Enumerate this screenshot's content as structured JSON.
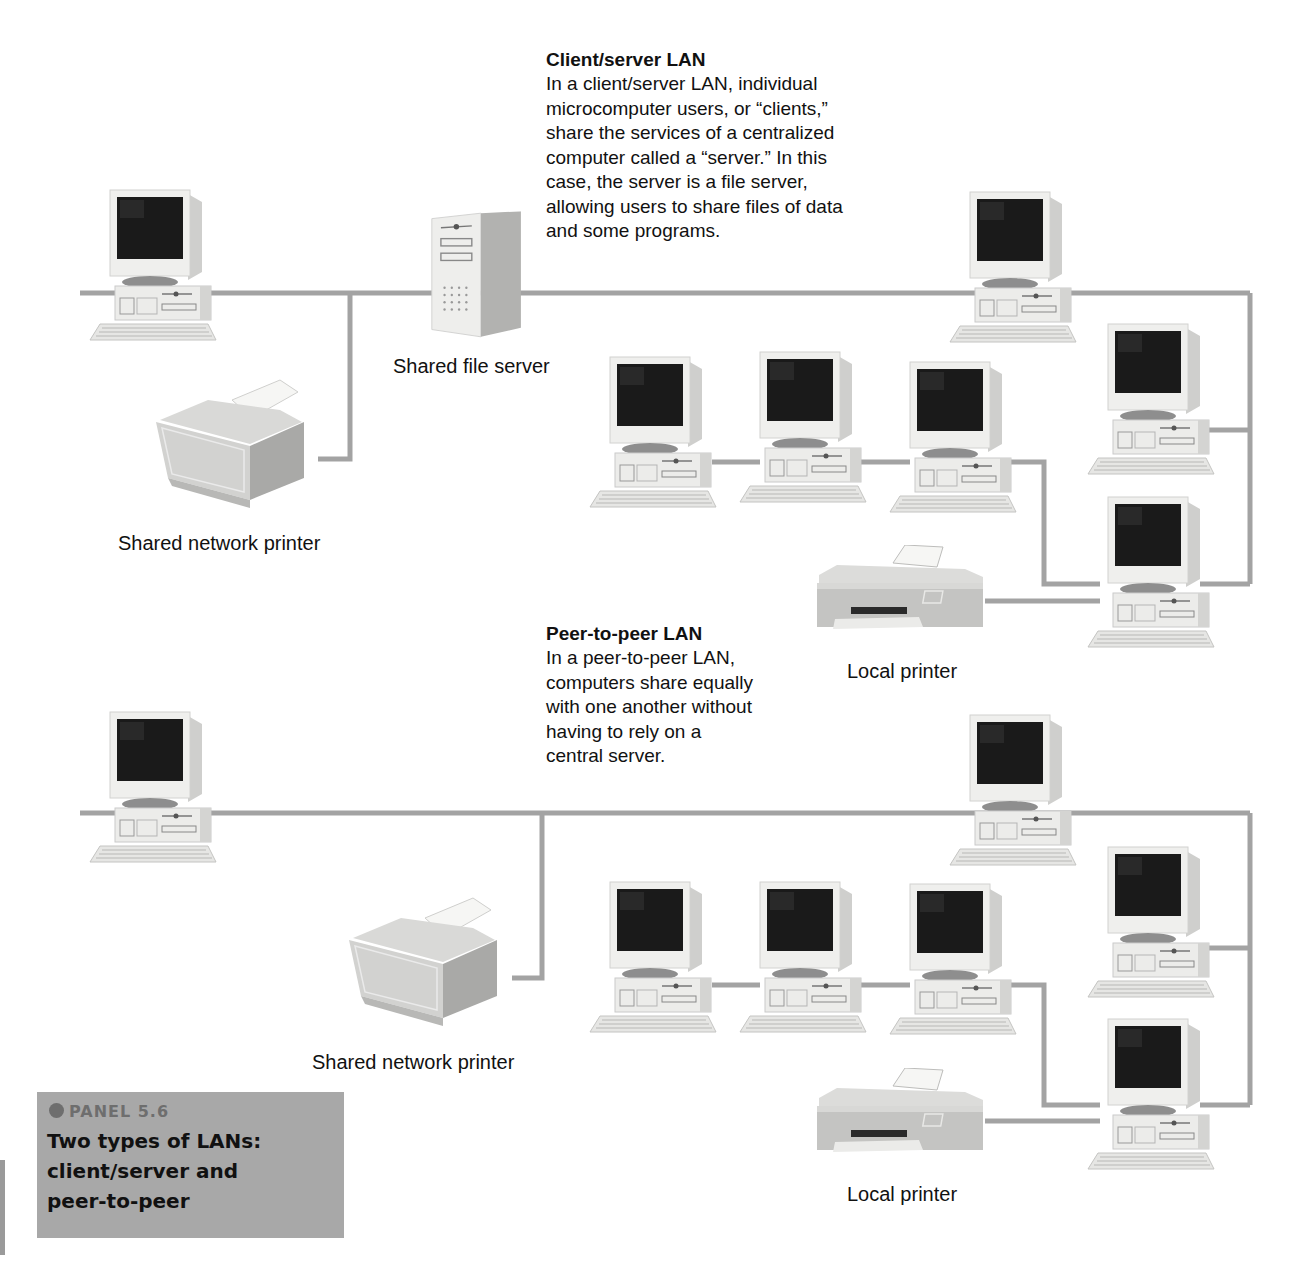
{
  "colors": {
    "wire": "#a3a3a3",
    "device_body": "#ececea",
    "device_shade": "#c9c9c7",
    "screen": "#1a1a1a",
    "panel_bg": "#a8a8a8",
    "panel_number": "#6e6e6e"
  },
  "client_server": {
    "title": "Client/server LAN",
    "description_lines": [
      "In a client/server LAN, individual",
      "microcomputer users, or “clients,”",
      "share the services of a centralized",
      "computer called a “server.” In this",
      "case, the server is a file server,",
      "allowing users to share files of data",
      "and some programs."
    ],
    "labels": {
      "file_server": "Shared file server",
      "network_printer": "Shared network printer",
      "local_printer": "Local printer"
    },
    "devices": {
      "computers": 7,
      "file_server": 1,
      "network_printer": 1,
      "local_printer": 1
    }
  },
  "peer_to_peer": {
    "title": "Peer-to-peer LAN",
    "description_lines": [
      "In a peer-to-peer LAN,",
      "computers share equally",
      "with one another without",
      "having to rely on a",
      "central server."
    ],
    "labels": {
      "network_printer": "Shared network printer",
      "local_printer": "Local printer"
    },
    "devices": {
      "computers": 7,
      "network_printer": 1,
      "local_printer": 1
    }
  },
  "panel": {
    "number": "PANEL 5.6",
    "title_lines": [
      "Two types of LANs:",
      "client/server and",
      "peer-to-peer"
    ]
  }
}
